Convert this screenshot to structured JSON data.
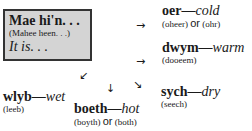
{
  "box": {
    "phrase": "Mae hi'n. . .",
    "pronunciation": "(Mahee heen. . .)",
    "translation": "It is. . ."
  },
  "entries": [
    {
      "welsh": "oer",
      "dash": "—",
      "english": "cold",
      "pron1": "(oheer)",
      "or": "or",
      "pron2": "(ohr)"
    },
    {
      "welsh": "dwym",
      "dash": "—",
      "english": "warm",
      "pron1": "(dooeem)"
    },
    {
      "welsh": "sych",
      "dash": "—",
      "english": "dry",
      "pron1": "(seech)"
    },
    {
      "welsh": "boeth",
      "dash": "—",
      "english": "hot",
      "pron1": "(boyth)",
      "or": "or",
      "pron2": "(both)"
    },
    {
      "welsh": "wlyb",
      "dash": "—",
      "english": "wet",
      "pron1": "(leeb)"
    }
  ],
  "arrows": {
    "right": "→",
    "down_left": "↙",
    "down": "↓",
    "down_right": "↘"
  }
}
